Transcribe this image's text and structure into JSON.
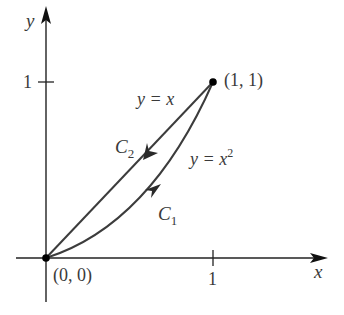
{
  "axes": {
    "x_label": "x",
    "y_label": "y",
    "x_tick": "1",
    "y_tick": "1"
  },
  "points": {
    "origin": "(0, 0)",
    "end": "(1, 1)"
  },
  "curves": {
    "c1": {
      "name": "C",
      "subscript": "1",
      "equation_lhs": "y = x",
      "equation_sup": "2",
      "direction": "from (0,0) to (1,1)"
    },
    "c2": {
      "name": "C",
      "subscript": "2",
      "equation": "y = x",
      "direction": "from (1,1) to (0,0)"
    }
  },
  "colors": {
    "axis": "#222222",
    "curve": "#3c3c3c",
    "text": "#3a3a3a"
  }
}
